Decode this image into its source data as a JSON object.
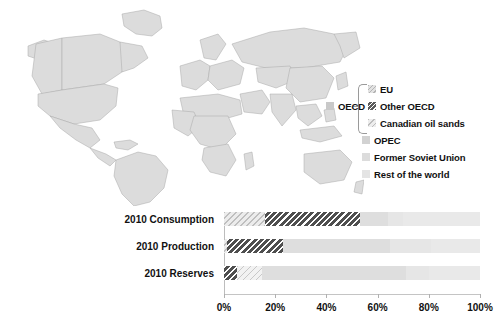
{
  "legend": {
    "group_label": "OECD",
    "group_swatch": "oecd-swatch",
    "items": [
      {
        "label": "EU",
        "swatch": "eu-swatch",
        "color": "#e2e2e2",
        "pattern": "light-hatch"
      },
      {
        "label": "Other OECD",
        "swatch": "other-oecd-swatch",
        "color": "#5a5a5a",
        "pattern": "dark-hatch"
      },
      {
        "label": "Canadian oil sands",
        "swatch": "canadian-oil-sands-swatch",
        "color": "#ededed",
        "pattern": "faint-hatch"
      },
      {
        "label": "OPEC",
        "swatch": "opec-swatch",
        "color": "#d2d2d2",
        "pattern": "solid"
      },
      {
        "label": "Former Soviet Union",
        "swatch": "former-soviet-union-swatch",
        "color": "#dcdcdc",
        "pattern": "solid"
      },
      {
        "label": "Rest of the world",
        "swatch": "rest-of-the-world-swatch",
        "color": "#e4e4e4",
        "pattern": "solid"
      }
    ]
  },
  "map": {
    "land_color": "#dcdcdc",
    "border_color": "#a8a8a8",
    "highlight_color": "#cfcfcf"
  },
  "chart_data": {
    "type": "bar",
    "orientation": "horizontal",
    "stacked": true,
    "title": "",
    "xlabel": "",
    "ylabel": "",
    "xlim": [
      0,
      100
    ],
    "xticks": [
      0,
      20,
      40,
      60,
      80,
      100
    ],
    "xtick_labels": [
      "0%",
      "20%",
      "40%",
      "60%",
      "80%",
      "100%"
    ],
    "grid": false,
    "legend_position": "upper-right-outside-map",
    "categories": [
      "2010 Consumption",
      "2010 Production",
      "2010 Reserves"
    ],
    "series": [
      {
        "name": "EU",
        "values": [
          16,
          1,
          0
        ]
      },
      {
        "name": "Other OECD",
        "values": [
          37,
          22,
          5
        ]
      },
      {
        "name": "Canadian oil sands",
        "values": [
          0,
          0,
          10
        ]
      },
      {
        "name": "OPEC",
        "values": [
          11,
          42,
          56
        ]
      },
      {
        "name": "Former Soviet Union",
        "values": [
          6,
          16,
          9
        ]
      },
      {
        "name": "Rest of the world",
        "values": [
          30,
          19,
          20
        ]
      }
    ]
  }
}
